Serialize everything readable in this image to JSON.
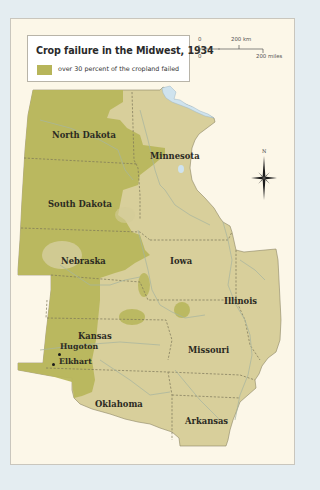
{
  "map": {
    "title": "Crop failure in the Midwest, 1934",
    "legend": {
      "items": [
        {
          "label": "over 30 percent of the cropland failed",
          "color": "#b7b55a"
        }
      ]
    },
    "scale": {
      "km_zero": "0",
      "km_label": "200 km",
      "mi_zero": "0",
      "mi_label": "200 miles"
    },
    "compass": {
      "north_label": "N"
    },
    "colors": {
      "background": "#e4edf1",
      "panel": "#fcf7e8",
      "land": "#d8cf9b",
      "failed": "#b7b55a",
      "water": "#cfe3ee",
      "borders": "#7a7458",
      "rivers": "#a9b7a0"
    },
    "states": [
      {
        "name": "North Dakota"
      },
      {
        "name": "Minnesota"
      },
      {
        "name": "South Dakota"
      },
      {
        "name": "Nebraska"
      },
      {
        "name": "Iowa"
      },
      {
        "name": "Illinois"
      },
      {
        "name": "Kansas"
      },
      {
        "name": "Missouri"
      },
      {
        "name": "Oklahoma"
      },
      {
        "name": "Arkansas"
      }
    ],
    "cities": [
      {
        "name": "Hugoton"
      },
      {
        "name": "Elkhart"
      }
    ]
  }
}
